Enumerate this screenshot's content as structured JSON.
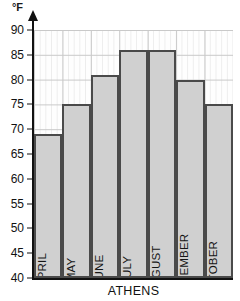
{
  "chart_data": {
    "type": "bar",
    "title": "",
    "xlabel": "ATHENS",
    "ylabel": "°F",
    "categories": [
      "APRIL",
      "MAY",
      "JUNE",
      "JULY",
      "AUGUST",
      "SEPTEMBER",
      "OCTOBER"
    ],
    "values": [
      69,
      75,
      81,
      86,
      86,
      80,
      75
    ],
    "ylim": [
      40,
      90
    ],
    "yticks": [
      40,
      45,
      50,
      55,
      60,
      65,
      70,
      75,
      80,
      85,
      90
    ],
    "grid": true,
    "legend": "none",
    "bar_count": 7,
    "colors": {
      "bar_fill": "#d0d0d0",
      "bar_border": "#4a4a4a",
      "axis": "#111111",
      "grid_major": "#c9c9c9",
      "grid_minor": "#ededed",
      "background": "#ffffff"
    }
  }
}
